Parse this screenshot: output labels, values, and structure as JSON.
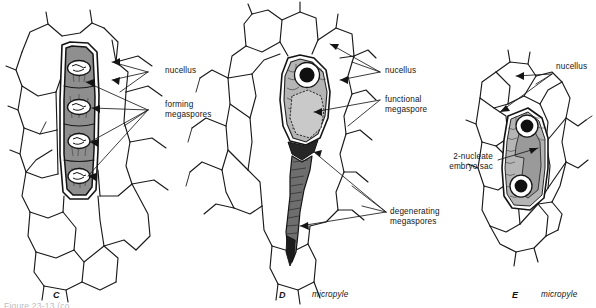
{
  "figure": {
    "background_color": "#ffffff",
    "ink_color": "#1a1a1a",
    "partial_caption": "Figure 23-13 (co"
  },
  "palette": {
    "nucellus_fill": "#ffffff",
    "megaspore_row_fill": "#8f8f8f",
    "functional_megaspore_fill": "#c9c9c9",
    "jacket_cell_fill": "#b5b5b5",
    "degenerating_fill": "#6e6e6e",
    "degenerating_dark_fill": "#262626",
    "embryo_sac_fill": "#9a9a9a",
    "nucleus_fill": "#101010",
    "nucleus_halo": "#ffffff"
  },
  "panels": [
    {
      "id": "C",
      "letter": "C",
      "sublabel": "",
      "description": "Four forming megaspores in a linear tetrad within the nucellus",
      "labels": [
        {
          "key": "nucellus",
          "text": "nucellus",
          "lines": 1
        },
        {
          "key": "forming_megaspores",
          "text": "forming\nmegaspores",
          "lines": 2
        }
      ]
    },
    {
      "id": "D",
      "letter": "D",
      "sublabel": "micropyle",
      "description": "One functional megaspore enlarged; three degenerating megaspores form a tail toward the micropyle",
      "labels": [
        {
          "key": "nucellus",
          "text": "nucellus",
          "lines": 1
        },
        {
          "key": "functional_megaspore",
          "text": "functional\nmegaspore",
          "lines": 2
        },
        {
          "key": "degenerating_megaspores",
          "text": "degenerating\nmegaspores",
          "lines": 2
        }
      ]
    },
    {
      "id": "E",
      "letter": "E",
      "sublabel": "micropyle",
      "description": "Two-nucleate embryo sac after the first mitotic division of the functional megaspore",
      "labels": [
        {
          "key": "nucellus",
          "text": "nucellus",
          "lines": 1
        },
        {
          "key": "embryo_sac",
          "text": "2-nucleate\nembryo sac",
          "lines": 2
        }
      ]
    }
  ],
  "labels_flat": {
    "c_nucellus": "nucellus",
    "c_forming_megaspores": "forming\nmegaspores",
    "d_nucellus": "nucellus",
    "d_functional_megaspore": "functional\nmegaspore",
    "d_degenerating_megaspores": "degenerating\nmegaspores",
    "e_nucellus": "nucellus",
    "e_embryo_sac": "2-nucleate\nembryo sac",
    "c_letter": "C",
    "d_letter": "D",
    "d_micropyle": "micropyle",
    "e_letter": "E",
    "e_micropyle": "micropyle"
  }
}
